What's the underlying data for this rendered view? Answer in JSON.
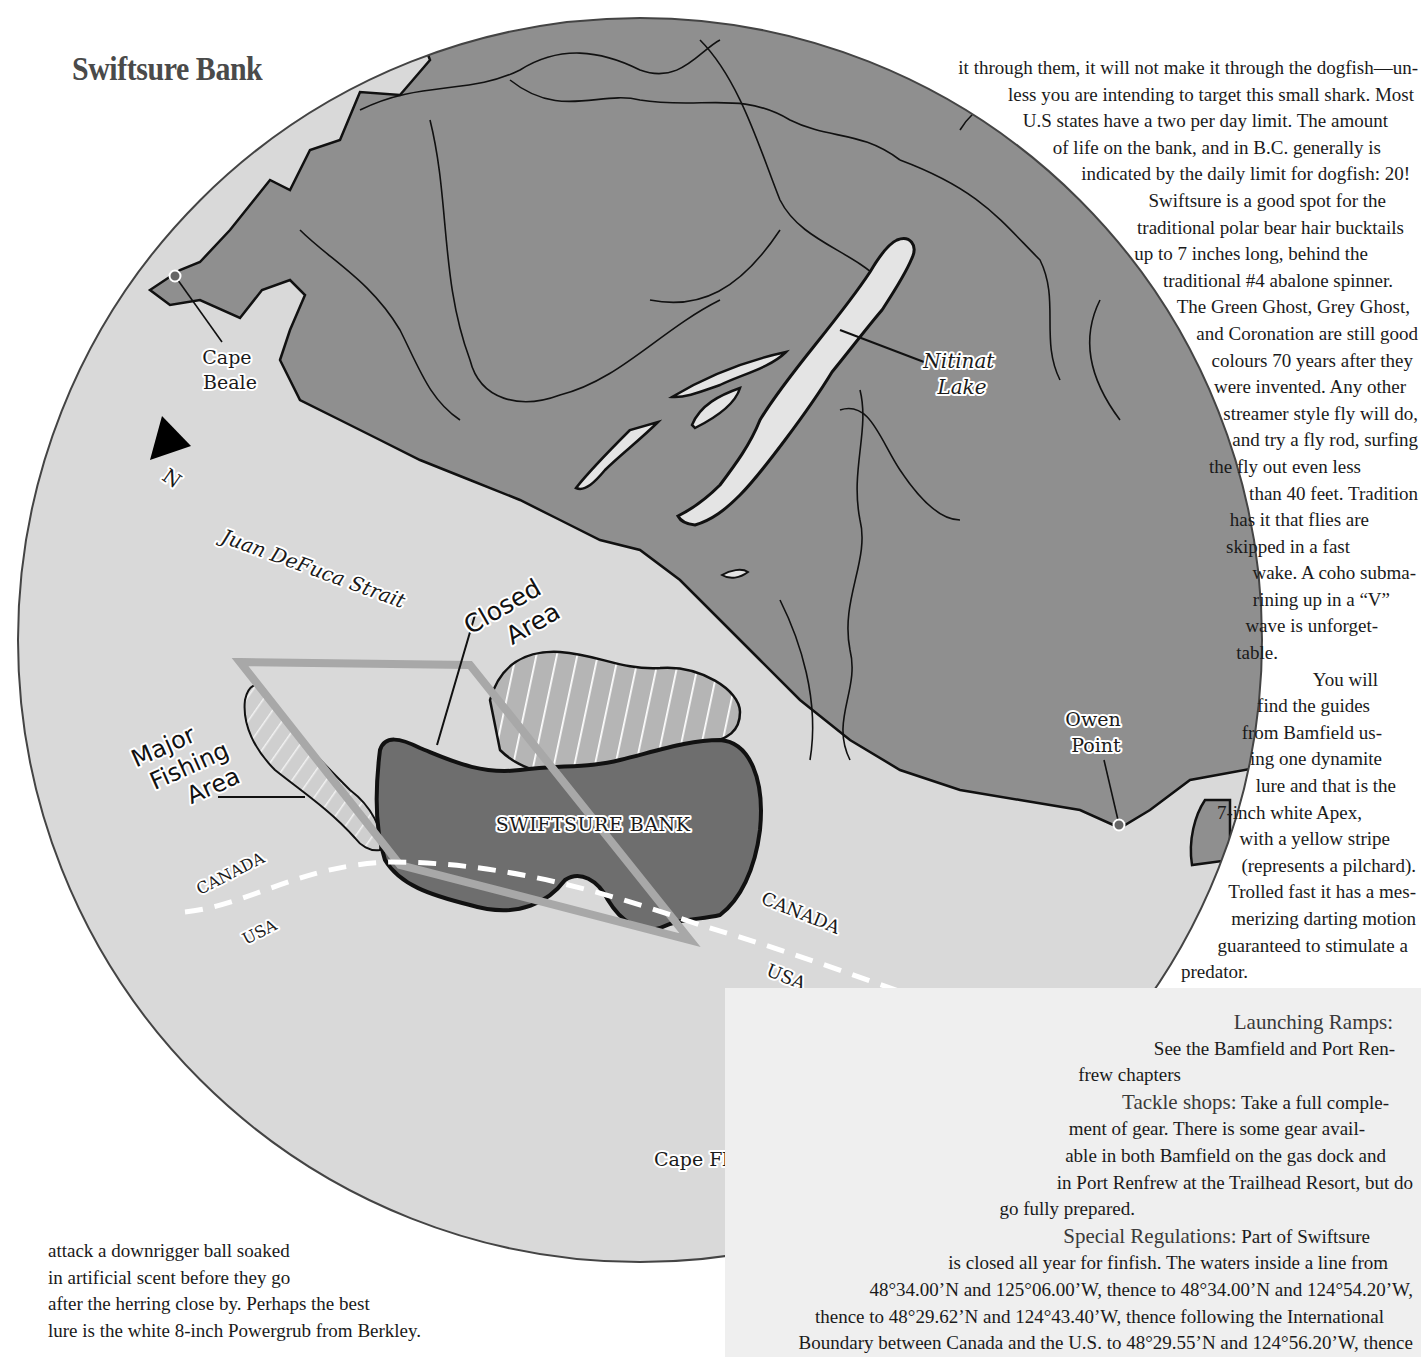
{
  "page": {
    "title": "Swiftsure Bank"
  },
  "map": {
    "colors": {
      "land": "#8f8f8f",
      "water": "#d9d9d9",
      "bank": "#6e6e6e",
      "outline": "#111111",
      "fishing_box": "#a8a8a8",
      "border_dash": "#ffffff"
    },
    "north_arrow": {
      "label": "N"
    },
    "labels": {
      "cape_beale": [
        "Cape",
        "Beale"
      ],
      "nitinat_lake": [
        "Nitinat",
        "Lake"
      ],
      "juan_defuca": "Juan DeFuca Strait",
      "closed_area": [
        "Closed",
        "Area"
      ],
      "major_fishing_area": [
        "Major",
        "Fishing",
        "Area"
      ],
      "swiftsure_bank": "SWIFTSURE BANK",
      "canada_left": "CANADA",
      "usa_left": "USA",
      "canada_right": "CANADA",
      "usa_right": "USA",
      "owen_point": [
        "Owen",
        "Point"
      ],
      "cape_flattery": "Cape Flattery"
    }
  },
  "right_column": {
    "lines": [
      "it through them, it will not make it through the dogfish—un-",
      "less you are intending to target this small shark. Most",
      "U.S states have a two per day limit. The amount",
      "of life on the bank, and in B.C. generally is",
      "indicated by the daily limit for dogfish: 20!",
      "Swiftsure is a good spot for the",
      "traditional polar bear hair bucktails",
      "up to 7 inches long, behind the",
      "traditional #4 abalone spinner.",
      "The Green Ghost, Grey Ghost,",
      "and Coronation are still good",
      "colours 70 years after they",
      "were invented. Any other",
      "streamer style fly will do,",
      "and try a fly rod, surfing",
      "the fly out even less",
      "than 40 feet. Tradition",
      "has it that flies are",
      "skipped in a fast",
      "wake. A coho subma-",
      "rining up in a “V”",
      "wave is unforget-",
      "table.",
      "You will",
      "find the guides",
      "from Bamfield us-",
      "ing one dynamite",
      "lure and that is the",
      "7-inch white Apex,",
      "with a yellow stripe",
      "(represents a pilchard).",
      "Trolled fast it has a mes-",
      "merizing darting motion",
      "guaranteed to stimulate a",
      "predator."
    ]
  },
  "sidebar": {
    "launching_ramps_heading": "Launching Ramps:",
    "launching_ramps_lines": [
      "See the Bamfield and Port Ren-",
      "frew chapters"
    ],
    "tackle_heading": "Tackle shops:",
    "tackle_lines": [
      " Take a full comple-",
      "ment of gear. There is some gear avail-",
      "able in both Bamfield on the gas dock and",
      "in Port Renfrew at the Trailhead Resort, but do",
      "go fully prepared."
    ],
    "regs_heading": "Special Regulations:",
    "regs_lines": [
      " Part of Swiftsure",
      "is closed all year for finfish. The waters inside a line from",
      "48°34.00’N and 125°06.00’W, thence to 48°34.00’N and 124°54.20’W,",
      "thence to 48°29.62’N and 124°43.40’W, thence following the International",
      "Boundary between Canada and the U.S. to 48°29.55’N and 124°56.20’W, thence"
    ]
  },
  "bottom_left": {
    "lines": [
      "attack a downrigger ball soaked",
      "in artificial scent before they go",
      "after the herring close by. Perhaps the best",
      "lure is the white 8-inch Powergrub from Berkley."
    ]
  }
}
